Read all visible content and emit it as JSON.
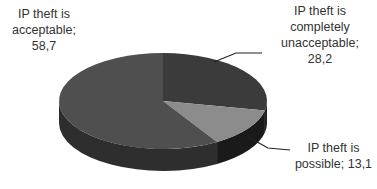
{
  "chart_data": {
    "type": "pie",
    "style": "3d",
    "title": "",
    "categories": [
      "IP theft is acceptable",
      "IP theft is completely unacceptable",
      "IP theft is possible"
    ],
    "values": [
      58.7,
      28.2,
      13.1
    ],
    "value_labels": [
      "58,7",
      "28,2",
      "13,1"
    ],
    "colors": [
      "#4f4f4f",
      "#3b3b3b",
      "#8c8c8c"
    ],
    "side_colors": [
      "#2e2e2e",
      "#222222",
      "#1a1a1a"
    ],
    "legend": "none",
    "data_labels": [
      {
        "lines": [
          "IP theft  is",
          "acceptable;",
          "58,7"
        ]
      },
      {
        "lines": [
          "IP theft is",
          "completely",
          "unacceptable;",
          "28,2"
        ]
      },
      {
        "lines": [
          "IP theft is",
          "possible; 13,1"
        ]
      }
    ]
  }
}
